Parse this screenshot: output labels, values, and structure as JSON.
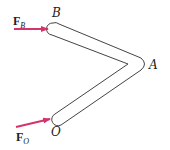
{
  "diagram": {
    "type": "bent-bar-free-body",
    "colors": {
      "bar_outline": "#444444",
      "bar_fill": "#ffffff",
      "force_arrow": "#d6336c",
      "text": "#222222"
    },
    "points": {
      "B": {
        "label": "B"
      },
      "A": {
        "label": "A"
      },
      "O": {
        "label": "O"
      }
    },
    "forces": [
      {
        "id": "FB",
        "symbol": "F",
        "subscript": "B",
        "applied_at": "B",
        "direction": "horizontal-right"
      },
      {
        "id": "FO",
        "symbol": "F",
        "subscript": "O",
        "applied_at": "O",
        "direction": "up-right"
      }
    ]
  }
}
